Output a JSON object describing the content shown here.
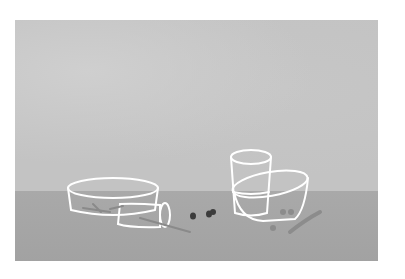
{
  "scene": {
    "description": "Minimal still-life illustration of glass vessels on a table",
    "colors": {
      "page": "#ffffff",
      "wall": "#c3c3c3",
      "table": "#a6a6a6",
      "outline": "#ffffff",
      "stick": "#8a8a8a",
      "bean": "#3c3c3c"
    },
    "objects": [
      "round-glass-dish",
      "tipped-glass",
      "tall-glass",
      "oval-glass-bowl",
      "sticks",
      "dark-beans",
      "gray-pebbles",
      "wavy-twig"
    ]
  }
}
